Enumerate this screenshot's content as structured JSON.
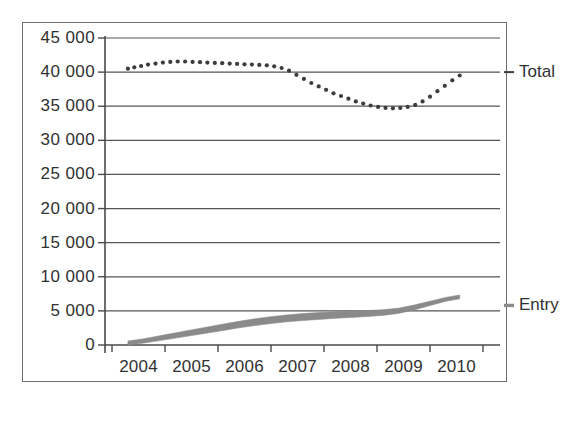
{
  "chart_data": {
    "type": "line",
    "title": "",
    "subtitle": "",
    "xlabel": "",
    "ylabel": "",
    "xlim": [
      2004,
      2010.92
    ],
    "ylim": [
      0,
      45000
    ],
    "grid": true,
    "grid_axis": "y",
    "legend_position": "right-inline",
    "y_ticks": [
      0,
      5000,
      10000,
      15000,
      20000,
      25000,
      30000,
      35000,
      40000,
      45000
    ],
    "y_tick_labels": [
      "0",
      "5 000",
      "10 000",
      "15 000",
      "20 000",
      "25 000",
      "30 000",
      "35 000",
      "40 000",
      "45 000"
    ],
    "x_ticks": [
      2004,
      2005,
      2006,
      2007,
      2008,
      2009,
      2010,
      2011
    ],
    "x_tick_labels": [
      "2004",
      "2005",
      "2006",
      "2007",
      "2008",
      "2009",
      "2010"
    ],
    "x_categories": [
      "2004",
      "2005",
      "2006",
      "2007",
      "2008",
      "2009",
      "2010"
    ],
    "series": [
      {
        "name": "Total",
        "label": "Total",
        "style": "dotted",
        "marker": "dot",
        "color": "#3d3d3d",
        "x": [
          2004.3,
          2004.42,
          2004.55,
          2004.68,
          2004.82,
          2004.96,
          2005.1,
          2005.24,
          2005.38,
          2005.52,
          2005.66,
          2005.8,
          2005.94,
          2006.08,
          2006.22,
          2006.36,
          2006.5,
          2006.64,
          2006.78,
          2006.92,
          2007.06,
          2007.2,
          2007.34,
          2007.48,
          2007.62,
          2007.76,
          2007.9,
          2008.04,
          2008.18,
          2008.32,
          2008.46,
          2008.6,
          2008.74,
          2008.88,
          2009.02,
          2009.16,
          2009.3,
          2009.44,
          2009.58,
          2009.72,
          2009.86,
          2010.0,
          2010.14,
          2010.28,
          2010.42,
          2010.56
        ],
        "values": [
          40500,
          40700,
          40900,
          41100,
          41250,
          41400,
          41500,
          41550,
          41550,
          41500,
          41450,
          41400,
          41350,
          41300,
          41250,
          41200,
          41150,
          41100,
          41050,
          41000,
          40850,
          40600,
          40200,
          39600,
          39000,
          38400,
          37900,
          37400,
          36900,
          36500,
          36100,
          35700,
          35400,
          35100,
          34900,
          34750,
          34700,
          34750,
          34900,
          35200,
          35700,
          36400,
          37200,
          38000,
          38800,
          39500
        ]
      },
      {
        "name": "Entry",
        "label": "Entry",
        "style": "solid-band",
        "marker": "none",
        "color": "#8a8a8a",
        "x": [
          2004.3,
          2004.6,
          2004.9,
          2005.2,
          2005.5,
          2005.8,
          2006.1,
          2006.4,
          2006.7,
          2007.0,
          2007.3,
          2007.6,
          2007.9,
          2008.2,
          2008.5,
          2008.8,
          2009.1,
          2009.4,
          2009.7,
          2010.0,
          2010.3,
          2010.56
        ],
        "values": [
          300,
          600,
          1000,
          1400,
          1800,
          2200,
          2600,
          3000,
          3350,
          3650,
          3900,
          4100,
          4250,
          4400,
          4500,
          4600,
          4750,
          5000,
          5500,
          6100,
          6700,
          7050
        ]
      }
    ],
    "annotations": []
  }
}
